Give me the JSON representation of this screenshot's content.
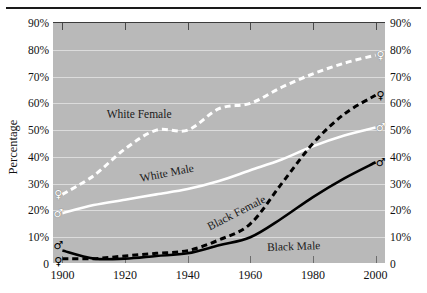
{
  "figure": {
    "clipped_header_text": "",
    "ylabel": "Percentage"
  },
  "axes": {
    "y_ticks": [
      "90%",
      "80%",
      "70%",
      "60%",
      "50%",
      "40%",
      "30%",
      "20%",
      "10%",
      "0"
    ],
    "y_values": [
      90,
      80,
      70,
      60,
      50,
      40,
      30,
      20,
      10,
      0
    ],
    "x_ticks": [
      "1900",
      "1920",
      "1940",
      "1960",
      "1980",
      "2000"
    ],
    "x_values": [
      1900,
      1920,
      1940,
      1960,
      1980,
      2000
    ]
  },
  "colors": {
    "plot_background": "#b9b9b9",
    "gridline": "#e2e2e2",
    "white_series": "#ffffff",
    "black_series": "#000000",
    "rule": "#1a1a1a"
  },
  "series_labels": {
    "white_female": "White Female",
    "white_male": "White Male",
    "black_female": "Black Female",
    "black_male": "Black Male"
  },
  "markers": {
    "female_symbol": "♀",
    "male_symbol": "♂"
  },
  "chart_data": {
    "type": "line",
    "title": "",
    "xlabel": "",
    "ylabel": "Percentage",
    "xlim": [
      1897,
      2003
    ],
    "ylim": [
      0,
      90
    ],
    "grid": true,
    "legend": "inline-labels",
    "x": [
      1900,
      1910,
      1920,
      1930,
      1940,
      1950,
      1960,
      1970,
      1980,
      1990,
      2000
    ],
    "series": [
      {
        "name": "White Female",
        "style": "dashed",
        "color": "#ffffff",
        "marker_start": "♀",
        "marker_end": "♀",
        "values": [
          26,
          33,
          43,
          50,
          50,
          58,
          60,
          66,
          71,
          75,
          78
        ]
      },
      {
        "name": "White Male",
        "style": "solid",
        "color": "#ffffff",
        "marker_start": "♂",
        "marker_end": "♂",
        "values": [
          19,
          22,
          24,
          26,
          28,
          31,
          35,
          39,
          44,
          48,
          51
        ]
      },
      {
        "name": "Black Female",
        "style": "dashed",
        "color": "#000000",
        "marker_start": "♀",
        "marker_end": "♀",
        "values": [
          2,
          2,
          3,
          4,
          5,
          9,
          15,
          30,
          45,
          56,
          63
        ]
      },
      {
        "name": "Black Male",
        "style": "solid",
        "color": "#000000",
        "marker_start": "♂",
        "marker_end": "♂",
        "values": [
          5,
          2,
          2,
          3,
          4,
          7,
          10,
          17,
          25,
          32,
          38
        ]
      }
    ]
  }
}
